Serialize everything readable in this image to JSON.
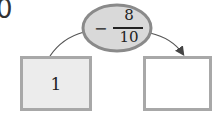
{
  "problem_label": "0",
  "operator": {
    "sign": "−",
    "numerator": "8",
    "denominator": "10",
    "fill_color": "#d9d9d9",
    "border_color": "#8a8a8a"
  },
  "input_box": {
    "value": "1",
    "fill_color": "#ececec"
  },
  "output_box": {
    "value": "",
    "fill_color": "#ffffff"
  },
  "box_border_color": "#a8a8a8",
  "arrow_color": "#444444"
}
